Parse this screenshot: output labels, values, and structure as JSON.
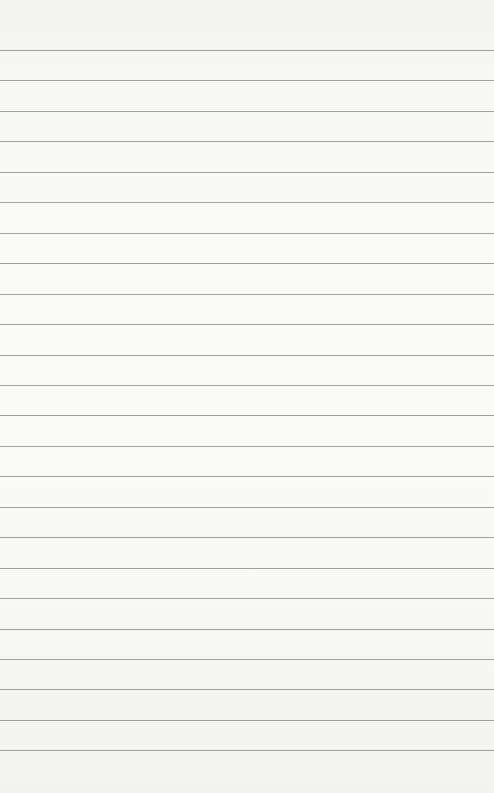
{
  "paper": {
    "background": "#f7f7f6",
    "line_color": "#8f8f8f",
    "line_count": 24,
    "first_line_y": 50,
    "line_spacing": 30.45
  }
}
